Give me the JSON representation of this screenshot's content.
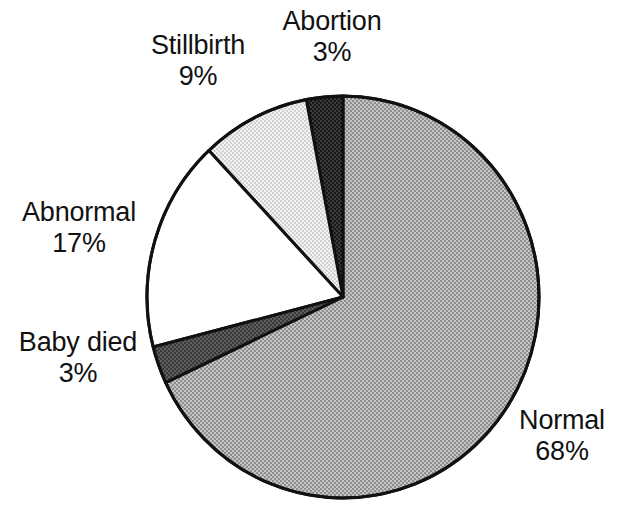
{
  "chart_data": {
    "type": "pie",
    "title": "",
    "subtitle": "",
    "xlabel": "",
    "ylabel": "",
    "legend_position": "none",
    "grid": false,
    "units": "percent",
    "total": 100,
    "start_angle_deg": 0,
    "direction": "mixed",
    "categories": [
      "Normal",
      "Abnormal",
      "Stillbirth",
      "Abortion",
      "Baby died"
    ],
    "values": [
      68,
      17,
      9,
      3,
      3
    ],
    "slices": [
      {
        "label": "Normal",
        "value": 68,
        "percent_text": "68%",
        "fill": "#a8a8a8",
        "pattern": "dither-50",
        "start_deg": 0,
        "end_deg": 244.8,
        "sweep": "clockwise"
      },
      {
        "label": "Abortion",
        "value": 3,
        "percent_text": "3%",
        "fill": "#2b2b2b",
        "pattern": "dither-90",
        "start_deg": 0,
        "end_deg": -10.8,
        "sweep": "counter-clockwise"
      },
      {
        "label": "Stillbirth",
        "value": 9,
        "percent_text": "9%",
        "fill": "#e2e2e2",
        "pattern": "dither-12",
        "start_deg": -10.8,
        "end_deg": -43.2,
        "sweep": "counter-clockwise"
      },
      {
        "label": "Abnormal",
        "value": 17,
        "percent_text": "17%",
        "fill": "#ffffff",
        "pattern": "solid",
        "start_deg": -43.2,
        "end_deg": -104.4,
        "sweep": "counter-clockwise"
      },
      {
        "label": "Baby died",
        "value": 3,
        "percent_text": "3%",
        "fill": "#4c4c4c",
        "pattern": "dither-75",
        "start_deg": -104.4,
        "end_deg": -115.2,
        "sweep": "counter-clockwise"
      }
    ],
    "geometry": {
      "center_x": 343,
      "center_y": 297,
      "radius_x": 196,
      "radius_y": 201,
      "outline_color": "#111111",
      "outline_width": 3
    }
  },
  "labels": {
    "stillbirth": {
      "name": "Stillbirth",
      "percent": "9%"
    },
    "abortion": {
      "name": "Abortion",
      "percent": "3%"
    },
    "abnormal": {
      "name": "Abnormal",
      "percent": "17%"
    },
    "baby_died": {
      "name": "Baby died",
      "percent": "3%"
    },
    "normal": {
      "name": "Normal",
      "percent": "68%"
    }
  },
  "colors": {
    "background": "#ffffff",
    "text": "#111111",
    "outline": "#111111",
    "normal_fill": "#a8a8a8",
    "abnormal_fill": "#ffffff",
    "stillbirth_fill": "#e2e2e2",
    "abortion_fill": "#2b2b2b",
    "baby_died_fill": "#4c4c4c"
  }
}
